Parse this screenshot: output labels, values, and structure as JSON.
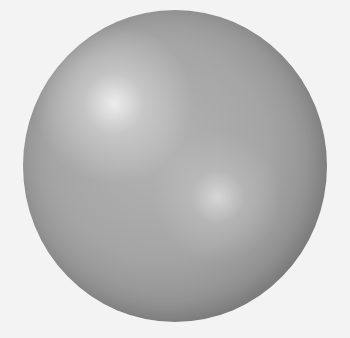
{
  "figure": {
    "highlights": 2,
    "colors": {
      "background": "#f3f3f3",
      "sphere_mid": "#a5a5a5",
      "sphere_edge": "#6f6f6f",
      "highlight": "#f0f0f0"
    }
  }
}
